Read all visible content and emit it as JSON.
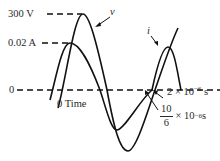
{
  "figure": {
    "type": "ac-waveform-phase-diagram",
    "curves": [
      {
        "id": "v",
        "label": "v",
        "quantity": "voltage",
        "peak": "300 V"
      },
      {
        "id": "i",
        "label": "i",
        "quantity": "current",
        "peak": "0.02 A"
      }
    ],
    "axis": {
      "zero_label": "0",
      "time_origin_label": "0 Time"
    },
    "peak_labels": {
      "voltage": "300 V",
      "current": "0.02 A"
    },
    "time_markers": {
      "t1": {
        "mantissa": "2 × 10",
        "exp": "−6",
        "unit": " s"
      },
      "t2": {
        "num": "10",
        "den": "6",
        "rest": "× 10",
        "exp": "−6",
        "unit": " s"
      }
    },
    "colors": {
      "stroke": "#111111",
      "text": "#2a2a2a",
      "background": "#ffffff"
    }
  }
}
